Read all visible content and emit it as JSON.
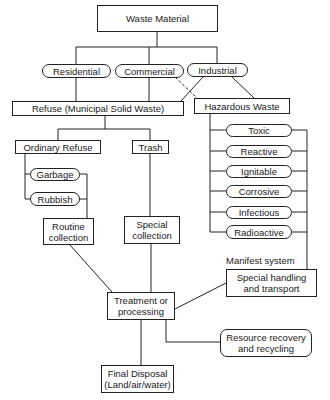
{
  "diagram": {
    "root": "Waste Material",
    "sources": [
      "Residential",
      "Commercial",
      "Industrial"
    ],
    "refuse": "Refuse (Municipal Solid Waste)",
    "hazardous": "Hazardous Waste",
    "ordinary_refuse": "Ordinary Refuse",
    "trash": "Trash",
    "ordinary_types": [
      "Garbage",
      "Rubbish"
    ],
    "hazard_types": [
      "Toxic",
      "Reactive",
      "Ignitable",
      "Corrosive",
      "Infectious",
      "Radioactive"
    ],
    "routine_collection": "Routine\ncollection",
    "special_collection": "Special\ncollection",
    "manifest_label": "Manifest system",
    "special_handling": "Special handling\nand transport",
    "treatment": "Treatment or\nprocessing",
    "resource_recovery": "Resource recovery\nand recycling",
    "final_disposal": "Final Disposal\n(Land/air/water)"
  },
  "colors": {
    "line": "#222222",
    "background": "#ffffff",
    "text": "#1a1a1a"
  }
}
